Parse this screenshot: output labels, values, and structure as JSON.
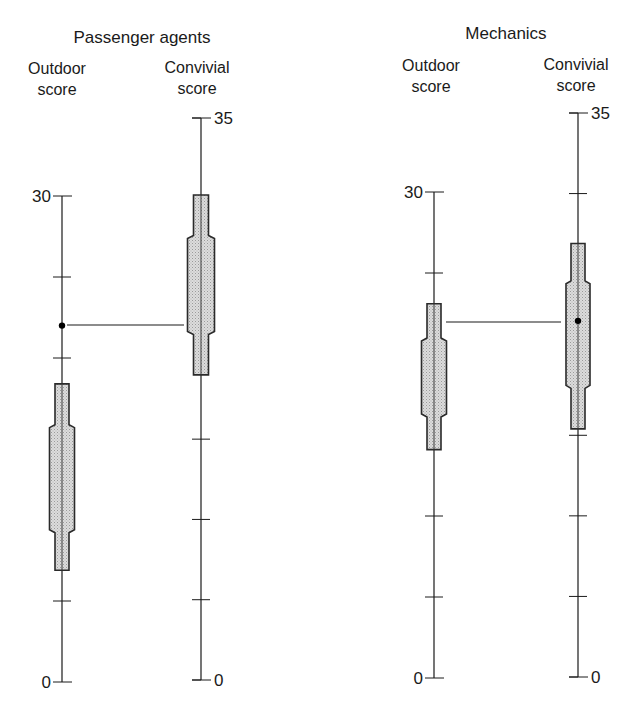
{
  "chart_data": [
    {
      "type": "box",
      "title": "Passenger agents",
      "panel_id": "passenger-agents",
      "axes": [
        {
          "label_line1": "Outdoor",
          "label_line2": "score",
          "min": 0,
          "max": 30,
          "tick_step": 5,
          "tick_labels": {
            "top": "30",
            "bottom": "0"
          },
          "label_side": "left",
          "box": {
            "outer_low": 6.9,
            "inner_low": 9.4,
            "inner_high": 15.7,
            "outer_high": 18.4
          },
          "marker": 22.0
        },
        {
          "label_line1": "Convivial",
          "label_line2": "score",
          "min": 0,
          "max": 35,
          "tick_step": 5,
          "tick_labels": {
            "top": "35",
            "bottom": "0"
          },
          "label_side": "right",
          "box": {
            "outer_low": 19.0,
            "inner_low": 21.7,
            "inner_high": 27.5,
            "outer_high": 30.2
          },
          "marker": null
        }
      ],
      "connector": {
        "from": "Outdoor marker 22.0",
        "to": "Convivial box"
      }
    },
    {
      "type": "box",
      "title": "Mechanics",
      "panel_id": "mechanics",
      "axes": [
        {
          "label_line1": "Outdoor",
          "label_line2": "score",
          "min": 0,
          "max": 30,
          "tick_step": 5,
          "tick_labels": {
            "top": "30",
            "bottom": "0"
          },
          "label_side": "left",
          "box": {
            "outer_low": 14.1,
            "inner_low": 16.3,
            "inner_high": 20.8,
            "outer_high": 23.1
          },
          "marker": null
        },
        {
          "label_line1": "Convivial",
          "label_line2": "score",
          "min": 0,
          "max": 35,
          "tick_step": 5,
          "tick_labels": {
            "top": "35",
            "bottom": "0"
          },
          "label_side": "right",
          "box": {
            "outer_low": 15.4,
            "inner_low": 18.1,
            "inner_high": 24.4,
            "outer_high": 26.9
          },
          "marker": 22.1
        }
      ],
      "connector": {
        "from": "Outdoor box",
        "to": "Convivial marker 22.1"
      }
    }
  ],
  "layout": {
    "panels": [
      {
        "title_x": 142,
        "title_y": 43,
        "axes": [
          {
            "x": 62,
            "y_top": 196,
            "y_bottom": 682,
            "label_x": 57,
            "label_y1": 74,
            "label_y2": 95,
            "narrow_half": 7,
            "wide_half": 12.5
          },
          {
            "x": 201,
            "y_top": 118,
            "y_bottom": 680,
            "label_x": 197,
            "label_y1": 73,
            "label_y2": 94,
            "narrow_half": 7.5,
            "wide_half": 13.5
          }
        ],
        "connector": {
          "x1": 67,
          "x2": 184,
          "y": 325
        }
      },
      {
        "title_x": 506,
        "title_y": 39,
        "axes": [
          {
            "x": 434,
            "y_top": 192,
            "y_bottom": 678,
            "label_x": 431,
            "label_y1": 71,
            "label_y2": 92,
            "narrow_half": 7,
            "wide_half": 12.5
          },
          {
            "x": 578,
            "y_top": 113,
            "y_bottom": 677,
            "label_x": 576,
            "label_y1": 70,
            "label_y2": 91,
            "narrow_half": 7,
            "wide_half": 12
          }
        ],
        "connector": {
          "x1": 446,
          "x2": 561,
          "y": 322
        }
      }
    ],
    "colors": {
      "ink": "#1a1a1a",
      "box_fill": "#d4d4d4",
      "box_stroke": "#2a2a2a",
      "background": "#ffffff"
    }
  }
}
